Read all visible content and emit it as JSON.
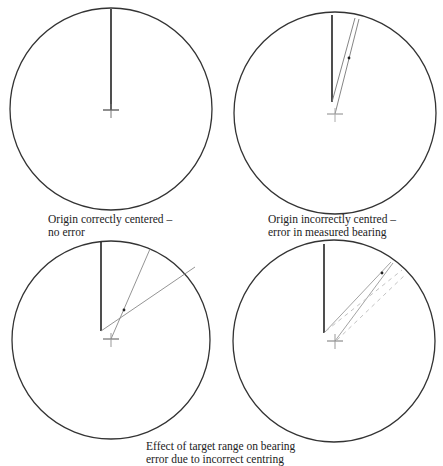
{
  "panels": [
    {
      "id": "correct",
      "caption_lines": [
        "Origin correctly centered –",
        "no error"
      ]
    },
    {
      "id": "incorrect",
      "caption_lines": [
        "Origin incorrectly centred –",
        "error in measured bearing"
      ]
    },
    {
      "id": "range-effect-close",
      "caption_lines": []
    },
    {
      "id": "range-effect-far",
      "caption_lines": []
    }
  ],
  "bottom_caption": {
    "lines": [
      "Effect of target range on bearing",
      "error due to incorrect centring"
    ]
  },
  "colors": {
    "circle": "#333333",
    "heading_line": "#222222",
    "bearing_line": "#888888",
    "background": "#ffffff"
  }
}
